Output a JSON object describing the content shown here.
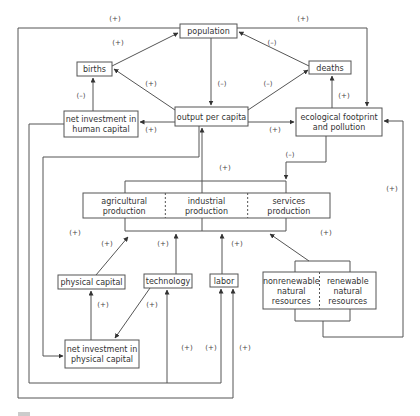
{
  "diagram": {
    "title": "",
    "colors": {
      "line": "#555555",
      "text": "#333333",
      "background": "#ffffff"
    },
    "nodes": [
      {
        "id": "population",
        "lines": [
          "population"
        ],
        "x": 180,
        "y": 24,
        "w": 57,
        "h": 14
      },
      {
        "id": "births",
        "lines": [
          "births"
        ],
        "x": 77,
        "y": 62,
        "w": 35,
        "h": 14
      },
      {
        "id": "deaths",
        "lines": [
          "deaths"
        ],
        "x": 309,
        "y": 61,
        "w": 42,
        "h": 13
      },
      {
        "id": "output-per-capita",
        "lines": [
          "output per capita"
        ],
        "x": 175,
        "y": 107,
        "w": 73,
        "h": 19
      },
      {
        "id": "net-investment-human-capital",
        "lines": [
          "net investment in",
          "human capital"
        ],
        "x": 64,
        "y": 111,
        "w": 74,
        "h": 26
      },
      {
        "id": "ecological-footprint",
        "lines": [
          "ecological footprint",
          "and pollution"
        ],
        "x": 296,
        "y": 108,
        "w": 86,
        "h": 28
      },
      {
        "id": "physical-capital",
        "lines": [
          "physical capital"
        ],
        "x": 58,
        "y": 275,
        "w": 67,
        "h": 14
      },
      {
        "id": "technology",
        "lines": [
          "technology"
        ],
        "x": 144,
        "y": 274,
        "w": 48,
        "h": 14
      },
      {
        "id": "labor",
        "lines": [
          "labor"
        ],
        "x": 210,
        "y": 274,
        "w": 28,
        "h": 13
      },
      {
        "id": "net-investment-physical-capital",
        "lines": [
          "net investment in",
          "physical capital"
        ],
        "x": 65,
        "y": 340,
        "w": 74,
        "h": 28
      }
    ],
    "production": {
      "x": 83,
      "y": 193,
      "w": 247,
      "h": 25,
      "sectors": [
        {
          "id": "agricultural",
          "lines": [
            "agricultural",
            "production"
          ]
        },
        {
          "id": "industrial",
          "lines": [
            "industrial",
            "production"
          ]
        },
        {
          "id": "services",
          "lines": [
            "services",
            "production"
          ]
        }
      ]
    },
    "resources": {
      "x": 263,
      "y": 272,
      "w": 113,
      "h": 37,
      "sectors": [
        {
          "id": "nonrenewable",
          "lines": [
            "nonrenewable",
            "natural",
            "resources"
          ]
        },
        {
          "id": "renewable",
          "lines": [
            "renewable",
            "natural",
            "resources"
          ]
        }
      ]
    },
    "edges": [
      {
        "id": "births-to-population",
        "points": [
          [
            112,
            66
          ],
          [
            178,
            33
          ]
        ],
        "arrow": true
      },
      {
        "id": "deaths-to-population",
        "points": [
          [
            309,
            66
          ],
          [
            239,
            32
          ]
        ],
        "arrow": true
      },
      {
        "id": "population-to-output",
        "points": [
          [
            211,
            38
          ],
          [
            211,
            105
          ]
        ],
        "arrow": true
      },
      {
        "id": "output-to-births",
        "points": [
          [
            175,
            110
          ],
          [
            114,
            69
          ]
        ],
        "arrow": true
      },
      {
        "id": "output-to-deaths",
        "points": [
          [
            248,
            110
          ],
          [
            308,
            70
          ]
        ],
        "arrow": true
      },
      {
        "id": "output-to-human-capital",
        "points": [
          [
            175,
            122
          ],
          [
            140,
            122
          ]
        ],
        "arrow": true
      },
      {
        "id": "human-capital-to-births",
        "points": [
          [
            93,
            111
          ],
          [
            93,
            78
          ]
        ],
        "arrow": true
      },
      {
        "id": "output-to-eco",
        "points": [
          [
            248,
            122
          ],
          [
            294,
            122
          ]
        ],
        "arrow": true
      },
      {
        "id": "eco-to-deaths",
        "points": [
          [
            332,
            108
          ],
          [
            332,
            76
          ]
        ],
        "arrow": true
      },
      {
        "id": "population-to-eco",
        "points": [
          [
            237,
            28
          ],
          [
            367,
            28
          ],
          [
            367,
            106
          ]
        ],
        "arrow": true
      },
      {
        "id": "population-outer-loop",
        "points": [
          [
            180,
            28
          ],
          [
            18,
            28
          ],
          [
            18,
            398
          ],
          [
            233,
            398
          ],
          [
            233,
            289
          ]
        ],
        "arrow": true
      },
      {
        "id": "human-capital-loop",
        "points": [
          [
            64,
            124
          ],
          [
            29,
            124
          ],
          [
            29,
            383
          ],
          [
            221,
            383
          ],
          [
            221,
            289
          ]
        ],
        "arrow": true
      },
      {
        "id": "tech-from-loop",
        "points": [
          [
            167,
            383
          ],
          [
            167,
            290
          ]
        ],
        "arrow": true
      },
      {
        "id": "output-to-physical-investment",
        "points": [
          [
            199,
            126
          ],
          [
            199,
            157
          ],
          [
            43,
            157
          ],
          [
            43,
            356
          ],
          [
            63,
            356
          ]
        ],
        "arrow": true
      },
      {
        "id": "physical-investment-to-physical-capital",
        "points": [
          [
            91,
            340
          ],
          [
            91,
            291
          ]
        ],
        "arrow": true
      },
      {
        "id": "technology-to-physical-investment",
        "points": [
          [
            150,
            288
          ],
          [
            115,
            338
          ]
        ],
        "arrow": true
      },
      {
        "id": "production-to-output",
        "points": [
          [
            202,
            181
          ],
          [
            202,
            128
          ]
        ],
        "arrow": true
      },
      {
        "id": "eco-to-production",
        "points": [
          [
            326,
            136
          ],
          [
            326,
            162
          ],
          [
            286,
            162
          ],
          [
            286,
            179
          ]
        ],
        "arrow": true
      },
      {
        "id": "physical-capital-to-production",
        "points": [
          [
            96,
            275
          ],
          [
            128,
            237
          ]
        ],
        "arrow": true
      },
      {
        "id": "technology-to-production",
        "points": [
          [
            176,
            274
          ],
          [
            176,
            234
          ]
        ],
        "arrow": true
      },
      {
        "id": "labor-to-production",
        "points": [
          [
            222,
            274
          ],
          [
            222,
            234
          ]
        ],
        "arrow": true
      },
      {
        "id": "resources-to-production",
        "points": [
          [
            309,
            261
          ],
          [
            270,
            234
          ]
        ],
        "arrow": true
      },
      {
        "id": "resources-to-eco",
        "points": [
          [
            323,
            321
          ],
          [
            323,
            337
          ],
          [
            403,
            337
          ],
          [
            403,
            121
          ],
          [
            384,
            121
          ]
        ],
        "arrow": true
      }
    ],
    "brackets": [
      {
        "id": "production-top",
        "points": [
          [
            125,
            193
          ],
          [
            125,
            181
          ],
          [
            286,
            181
          ],
          [
            286,
            193
          ]
        ]
      },
      {
        "id": "production-bottom",
        "points": [
          [
            125,
            218
          ],
          [
            125,
            231
          ],
          [
            286,
            231
          ],
          [
            286,
            218
          ]
        ]
      },
      {
        "id": "production-bottom-mid",
        "points": [
          [
            202,
            218
          ],
          [
            202,
            231
          ]
        ]
      },
      {
        "id": "production-top-mid",
        "points": [
          [
            202,
            181
          ],
          [
            202,
            193
          ]
        ]
      },
      {
        "id": "resources-top",
        "points": [
          [
            295,
            272
          ],
          [
            295,
            261
          ],
          [
            350,
            261
          ],
          [
            350,
            272
          ]
        ]
      },
      {
        "id": "resources-bottom",
        "points": [
          [
            295,
            309
          ],
          [
            295,
            321
          ],
          [
            350,
            321
          ],
          [
            350,
            309
          ]
        ]
      }
    ],
    "signs": [
      {
        "id": "sign-population-outer",
        "text": "(+)",
        "x": 115,
        "y": 21
      },
      {
        "id": "sign-population-eco",
        "text": "(+)",
        "x": 303,
        "y": 21
      },
      {
        "id": "sign-births-population",
        "text": "(+)",
        "x": 118,
        "y": 45
      },
      {
        "id": "sign-deaths-population",
        "text": "(–)",
        "x": 272,
        "y": 45
      },
      {
        "id": "sign-output-births",
        "text": "(+)",
        "x": 151,
        "y": 86
      },
      {
        "id": "sign-population-output",
        "text": "(–)",
        "x": 222,
        "y": 86
      },
      {
        "id": "sign-output-deaths",
        "text": "(–)",
        "x": 268,
        "y": 86
      },
      {
        "id": "sign-human-births",
        "text": "(–)",
        "x": 81,
        "y": 98
      },
      {
        "id": "sign-eco-deaths",
        "text": "(+)",
        "x": 344,
        "y": 98
      },
      {
        "id": "sign-output-human",
        "text": "(+)",
        "x": 151,
        "y": 132
      },
      {
        "id": "sign-output-eco",
        "text": "(+)",
        "x": 275,
        "y": 132
      },
      {
        "id": "sign-eco-production",
        "text": "(–)",
        "x": 290,
        "y": 157
      },
      {
        "id": "sign-production-output",
        "text": "(+)",
        "x": 225,
        "y": 170
      },
      {
        "id": "sign-resources-eco",
        "text": "(+)",
        "x": 392,
        "y": 191
      },
      {
        "id": "sign-loop-left",
        "text": "(+)",
        "x": 75,
        "y": 235
      },
      {
        "id": "sign-resources-production",
        "text": "(+)",
        "x": 326,
        "y": 235
      },
      {
        "id": "sign-physical-production",
        "text": "(+)",
        "x": 107,
        "y": 246
      },
      {
        "id": "sign-technology-production",
        "text": "(+)",
        "x": 163,
        "y": 246
      },
      {
        "id": "sign-labor-production",
        "text": "(+)",
        "x": 237,
        "y": 246
      },
      {
        "id": "sign-investment-physical",
        "text": "(+)",
        "x": 103,
        "y": 307
      },
      {
        "id": "sign-technology-investment",
        "text": "(+)",
        "x": 152,
        "y": 307
      },
      {
        "id": "sign-tech-loop",
        "text": "(+)",
        "x": 187,
        "y": 350
      },
      {
        "id": "sign-labor-inner",
        "text": "(+)",
        "x": 211,
        "y": 350
      },
      {
        "id": "sign-labor-outer",
        "text": "(+)",
        "x": 245,
        "y": 350
      }
    ],
    "legend": {
      "swatch": {
        "x": 18,
        "y": 412,
        "w": 12,
        "h": 4
      }
    }
  }
}
